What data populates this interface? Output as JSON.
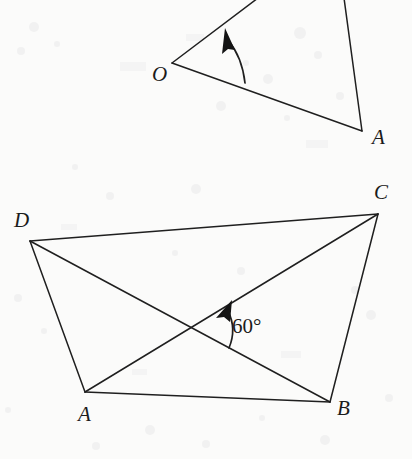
{
  "figure": {
    "background_color": "#fbfbfa",
    "stroke_color": "#1f1f1f",
    "text_color": "#1b1b1b"
  },
  "top_figure": {
    "name": "angle-at-O-figure",
    "vertex_labels": [
      {
        "text": "O",
        "x": 152,
        "y": 64
      },
      {
        "text": "A",
        "x": 372,
        "y": 127
      }
    ],
    "points": {
      "O": {
        "x": 172,
        "y": 63
      },
      "A": {
        "x": 362,
        "y": 131
      },
      "upper_ray_end": {
        "x": 258,
        "y": -2
      },
      "right_edge_top": {
        "x": 344,
        "y": -2
      }
    },
    "segments": [
      {
        "name": "ray-O-up",
        "from": "O",
        "to": "upper_ray_end"
      },
      {
        "name": "ray-O-A",
        "from": "O",
        "to": "A"
      },
      {
        "name": "edge-top-A",
        "from": "right_edge_top",
        "to": "A"
      }
    ],
    "angle_arc": {
      "name": "rotation-arc-O",
      "direction": "counterclockwise",
      "arrow_at": "upper-ray",
      "label": ""
    }
  },
  "bottom_figure": {
    "name": "quadrilateral-ABCD-figure",
    "vertex_labels": [
      {
        "text": "D",
        "x": 14,
        "y": 210
      },
      {
        "text": "C",
        "x": 374,
        "y": 182
      },
      {
        "text": "A",
        "x": 78,
        "y": 404
      },
      {
        "text": "B",
        "x": 337,
        "y": 398
      }
    ],
    "points": {
      "D": {
        "x": 30,
        "y": 241
      },
      "C": {
        "x": 378,
        "y": 214
      },
      "B": {
        "x": 330,
        "y": 402
      },
      "A": {
        "x": 85,
        "y": 392
      },
      "diagonal_intersection": {
        "x": 188,
        "y": 325
      }
    },
    "segments": [
      {
        "name": "side-DC",
        "from": "D",
        "to": "C"
      },
      {
        "name": "side-CB",
        "from": "C",
        "to": "B"
      },
      {
        "name": "side-BA",
        "from": "B",
        "to": "A"
      },
      {
        "name": "side-AD",
        "from": "A",
        "to": "D"
      },
      {
        "name": "diagonal-AC",
        "from": "A",
        "to": "C"
      },
      {
        "name": "diagonal-DB",
        "from": "D",
        "to": "B"
      }
    ],
    "angle_arc": {
      "name": "rotation-arc-60",
      "direction": "counterclockwise",
      "arrow_at": "diagonal-AC",
      "label": "60°",
      "label_x": 232,
      "label_y": 316
    }
  }
}
